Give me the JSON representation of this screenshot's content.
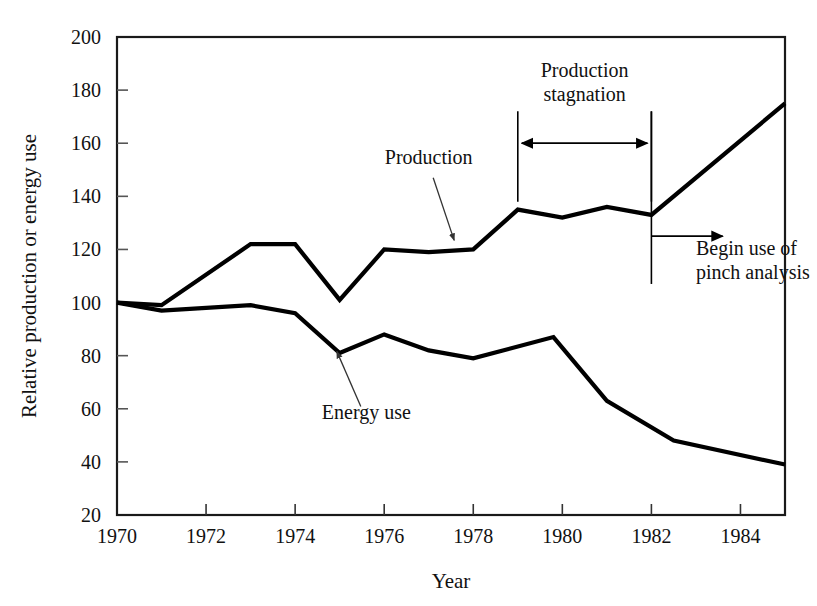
{
  "chart_data": {
    "type": "line",
    "title": "",
    "xlabel": "Year",
    "ylabel": "Relative production or energy use",
    "xlim": [
      1970,
      1985
    ],
    "ylim": [
      20,
      200
    ],
    "xticks": [
      1970,
      1972,
      1974,
      1976,
      1978,
      1980,
      1982,
      1984
    ],
    "xtick_labels": [
      "1970",
      "1972",
      "1974",
      "1976",
      "1978",
      "1980",
      "1982",
      "1984"
    ],
    "yticks": [
      20,
      40,
      60,
      80,
      100,
      120,
      140,
      160,
      180,
      200
    ],
    "ytick_labels": [
      "20",
      "40",
      "60",
      "80",
      "100",
      "120",
      "140",
      "160",
      "180",
      "200"
    ],
    "grid": false,
    "legend": "none",
    "series": [
      {
        "name": "Production",
        "color": "#000000",
        "x": [
          1970,
          1971,
          1973,
          1974,
          1975,
          1976,
          1977,
          1978,
          1979,
          1980,
          1981,
          1982,
          1985
        ],
        "values": [
          100,
          99,
          122,
          122,
          101,
          120,
          119,
          120,
          135,
          132,
          136,
          133,
          175
        ]
      },
      {
        "name": "Energy use",
        "color": "#000000",
        "x": [
          1970,
          1971,
          1973,
          1974,
          1975,
          1976,
          1977,
          1978,
          1979.8,
          1981,
          1982.5,
          1985
        ],
        "values": [
          100,
          97,
          99,
          96,
          81,
          88,
          82,
          79,
          87,
          63,
          48,
          39
        ]
      }
    ],
    "annotations": [
      {
        "id": "production-label",
        "text": "Production",
        "label_x": 1977.0,
        "label_y": 152,
        "point_x": 1977.6,
        "point_y": 122
      },
      {
        "id": "energy-use-label",
        "text": "Energy use",
        "label_x": 1975.6,
        "label_y": 56,
        "point_x": 1974.9,
        "point_y": 83
      },
      {
        "id": "production-stagnation",
        "text_line_1": "Production",
        "text_line_2": "stagnation",
        "span_start_x": 1979.0,
        "span_end_x": 1982.0,
        "arrow_y": 160,
        "rule_top_y": 172,
        "rule_bottom_y": 138
      },
      {
        "id": "begin-pinch-analysis",
        "text_line_1": "Begin use of",
        "text_line_2": "pinch analysis",
        "marker_x": 1982.0,
        "marker_top_y": 172,
        "marker_bottom_y": 107,
        "arrow_y": 125,
        "arrow_end_x": 1983.6,
        "text_x": 1983.0,
        "text_y": 118
      }
    ]
  }
}
